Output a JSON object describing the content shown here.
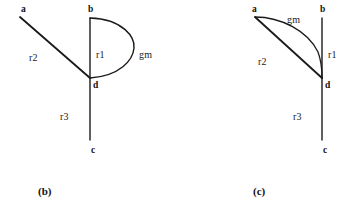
{
  "figure": {
    "background_color": "#ffffff",
    "stroke_color": "#1a1a1a",
    "panels": [
      {
        "id": "panel-b",
        "caption": "(b)",
        "caption_x": 38,
        "caption_y": 185,
        "nodes": [
          {
            "name": "a",
            "label": "a",
            "x": 21,
            "y": 4
          },
          {
            "name": "b",
            "label": "b",
            "x": 88,
            "y": 4
          },
          {
            "name": "d",
            "label": "d",
            "x": 93,
            "y": 80
          },
          {
            "name": "c",
            "label": "c",
            "x": 91,
            "y": 145
          }
        ],
        "edges": [
          {
            "name": "r1",
            "label": "r1",
            "label_x": 96,
            "label_y": 49,
            "kind": "straight-vertical"
          },
          {
            "name": "r2",
            "label": "r2",
            "label_x": 29,
            "label_y": 52,
            "kind": "straight-diagonal"
          },
          {
            "name": "r3",
            "label": "r3",
            "label_x": 60,
            "label_y": 111,
            "kind": "straight-vertical"
          },
          {
            "name": "gm",
            "label": "gm",
            "label_x": 139,
            "label_y": 49,
            "kind": "semicircle-arc"
          }
        ]
      },
      {
        "id": "panel-c",
        "caption": "(c)",
        "caption_x": 253,
        "caption_y": 185,
        "nodes": [
          {
            "name": "a",
            "label": "a",
            "x": 252,
            "y": 4
          },
          {
            "name": "b",
            "label": "b",
            "x": 320,
            "y": 4
          },
          {
            "name": "d",
            "label": "d",
            "x": 325,
            "y": 80
          },
          {
            "name": "c",
            "label": "c",
            "x": 323,
            "y": 145
          },
          {
            "name": "gm",
            "label": "gm",
            "x": 287,
            "y": 14
          }
        ],
        "edges": [
          {
            "name": "r1",
            "label": "r1",
            "label_x": 328,
            "label_y": 49,
            "kind": "straight-vertical"
          },
          {
            "name": "r2",
            "label": "r2",
            "label_x": 258,
            "label_y": 56,
            "kind": "straight-diagonal"
          },
          {
            "name": "r3",
            "label": "r3",
            "label_x": 293,
            "label_y": 111,
            "kind": "straight-vertical"
          },
          {
            "name": "gm",
            "label": "gm",
            "label_x": 287,
            "label_y": 14,
            "kind": "curved-arc"
          }
        ]
      }
    ]
  }
}
